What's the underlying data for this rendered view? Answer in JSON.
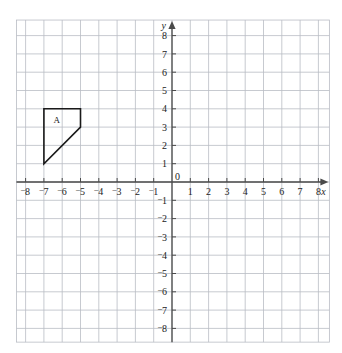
{
  "figure": {
    "type": "coordinate-grid",
    "background_color": "#ffffff",
    "grid_color": "#b9bcc4",
    "axis_color": "#4a4a4a",
    "shape_color": "#1a1a1a",
    "label_color": "#222222"
  },
  "axes": {
    "x_axis_name": "x",
    "y_axis_name": "y",
    "origin_label": "0",
    "x_range": [
      -8.5,
      8.6
    ],
    "y_range": [
      -8.75,
      8.85
    ],
    "x_tick_values": [
      -8,
      -7,
      -6,
      -5,
      -4,
      -3,
      -2,
      -1,
      1,
      2,
      3,
      4,
      5,
      6,
      7,
      8
    ],
    "y_tick_values": [
      -8,
      -7,
      -6,
      -5,
      -4,
      -3,
      -2,
      -1,
      1,
      2,
      3,
      4,
      5,
      6,
      7,
      8
    ],
    "x_tick_labels": [
      "‑8",
      "‑7",
      "‑6",
      "‑5",
      "‑4",
      "‑3",
      "‑2",
      "‑1",
      "1",
      "2",
      "3",
      "4",
      "5",
      "6",
      "7",
      "8"
    ],
    "y_tick_labels": [
      "‑8",
      "‑7",
      "‑6",
      "‑5",
      "‑4",
      "‑3",
      "‑2",
      "‑1",
      "1",
      "2",
      "3",
      "4",
      "5",
      "6",
      "7",
      "8"
    ],
    "negative_sign_style": "raised-minus",
    "grid_spacing_units": 1,
    "grid_visible": true,
    "arrowheads": [
      "x-positive",
      "y-positive"
    ]
  },
  "chart_data": {
    "type": "scatter",
    "title": "",
    "xlabel": "x",
    "ylabel": "y",
    "xlim": [
      -8.5,
      8.6
    ],
    "ylim": [
      -8.75,
      8.85
    ],
    "grid": true,
    "legend": "none",
    "shapes": [
      {
        "label": "A",
        "kind": "polygon",
        "vertices": [
          [
            -7,
            4
          ],
          [
            -5,
            4
          ],
          [
            -5,
            3
          ],
          [
            -7,
            1
          ]
        ],
        "label_position": [
          -6.3,
          3.25
        ],
        "fill": "none",
        "stroke": "#1a1a1a",
        "stroke_width": 1.6
      }
    ]
  }
}
